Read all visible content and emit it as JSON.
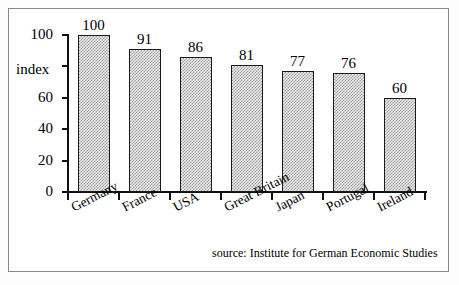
{
  "figure": {
    "source_note": "source: Institute for German Economic Studies",
    "frame_color": "#8a8a8a",
    "axis_color": "#111111",
    "bar_fill_color": "#ececec",
    "bar_pattern_color": "#9b9b9b",
    "bar_edge_color": "#1a1a1a",
    "background_color": "#ffffff"
  },
  "chart_data": {
    "type": "bar",
    "title": "",
    "subtitle": "",
    "xlabel": "",
    "ylabel": "index",
    "categories": [
      "Germany",
      "France",
      "USA",
      "Great Britain",
      "Japan",
      "Portugal",
      "Ireland"
    ],
    "values": [
      100,
      91,
      86,
      81,
      77,
      76,
      60
    ],
    "value_labels": [
      "100",
      "91",
      "86",
      "81",
      "77",
      "76",
      "60"
    ],
    "ylim": [
      0,
      100
    ],
    "ytick_values": [
      100,
      80,
      60,
      40,
      20,
      0
    ],
    "ytick_labels": [
      "100",
      "",
      "60",
      "40",
      "20",
      "0"
    ],
    "grid": false,
    "legend": null,
    "annotations": [
      "source: Institute for German Economic Studies"
    ]
  }
}
